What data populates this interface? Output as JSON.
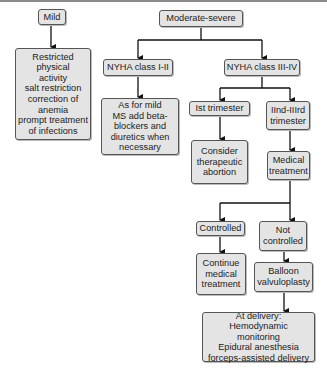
{
  "diagram": {
    "nodes": {
      "mild": {
        "lines": [
          "Mild"
        ]
      },
      "mild_treatment": {
        "lines": [
          "Restricted",
          "physical",
          "activity",
          "salt restriction",
          "correction  of",
          "anemia",
          "prompt treatment",
          "of infections"
        ]
      },
      "moderate_severe": {
        "lines": [
          "Moderate-severe"
        ]
      },
      "nyha_1_2": {
        "lines": [
          "NYHA class I-II"
        ]
      },
      "nyha_3_4": {
        "lines": [
          "NYHA class III-IV"
        ]
      },
      "nyha_1_2_treatment": {
        "lines": [
          "As for mild",
          "MS add beta-",
          "blockers and",
          "diuretics when",
          "necessary"
        ]
      },
      "first_trimester": {
        "lines": [
          "Ist trimester"
        ]
      },
      "second_third_trimester": {
        "lines": [
          "IInd-IIIrd",
          "trimester"
        ]
      },
      "consider_abortion": {
        "lines": [
          "Consider",
          "therapeutic",
          "abortion"
        ]
      },
      "medical_treatment": {
        "lines": [
          "Medical",
          "treatment"
        ]
      },
      "controlled": {
        "lines": [
          "Controlled"
        ]
      },
      "not_controlled": {
        "lines": [
          "Not",
          "controlled"
        ]
      },
      "continue_medical": {
        "lines": [
          "Continue",
          "medical",
          "treatment"
        ]
      },
      "balloon": {
        "lines": [
          "Balloon",
          "valvuloplasty"
        ]
      },
      "at_delivery": {
        "lines": [
          "At delivery:",
          "Hemodynamic",
          "monitoring",
          "Epidural anesthesia",
          "forceps-assisted delivery"
        ]
      }
    },
    "colors": {
      "box_fill": "#e4e4e4",
      "box_border": "#555555",
      "line": "#111111"
    }
  }
}
